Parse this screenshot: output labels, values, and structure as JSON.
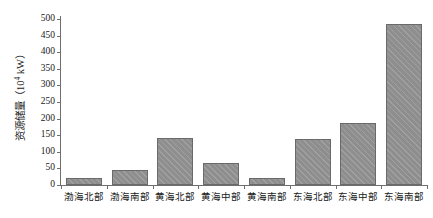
{
  "chart_data": {
    "type": "bar",
    "title": "",
    "xlabel": "",
    "ylabel": "资源储量（10⁴ kW）",
    "ylabel_text": "资源储量（10",
    "ylabel_sup": "4",
    "ylabel_tail": " kW）",
    "ylim": [
      0,
      500
    ],
    "ytick_step": 50,
    "yticks": [
      "0",
      "50",
      "100",
      "150",
      "200",
      "250",
      "300",
      "350",
      "400",
      "450",
      "500"
    ],
    "ytick_values": [
      0,
      50,
      100,
      150,
      200,
      250,
      300,
      350,
      400,
      450,
      500
    ],
    "grid": false,
    "legend": "none",
    "categories": [
      "渤海北部",
      "渤海南部",
      "黄海北部",
      "黄海中部",
      "黄海南部",
      "东海北部",
      "东海中部",
      "东海南部"
    ],
    "values": [
      20,
      45,
      142,
      65,
      22,
      140,
      188,
      485
    ],
    "bar_color": "#8e8e8e",
    "bar_edge_color": "#6a6a6a",
    "axis_color": "#6f6f6f"
  }
}
